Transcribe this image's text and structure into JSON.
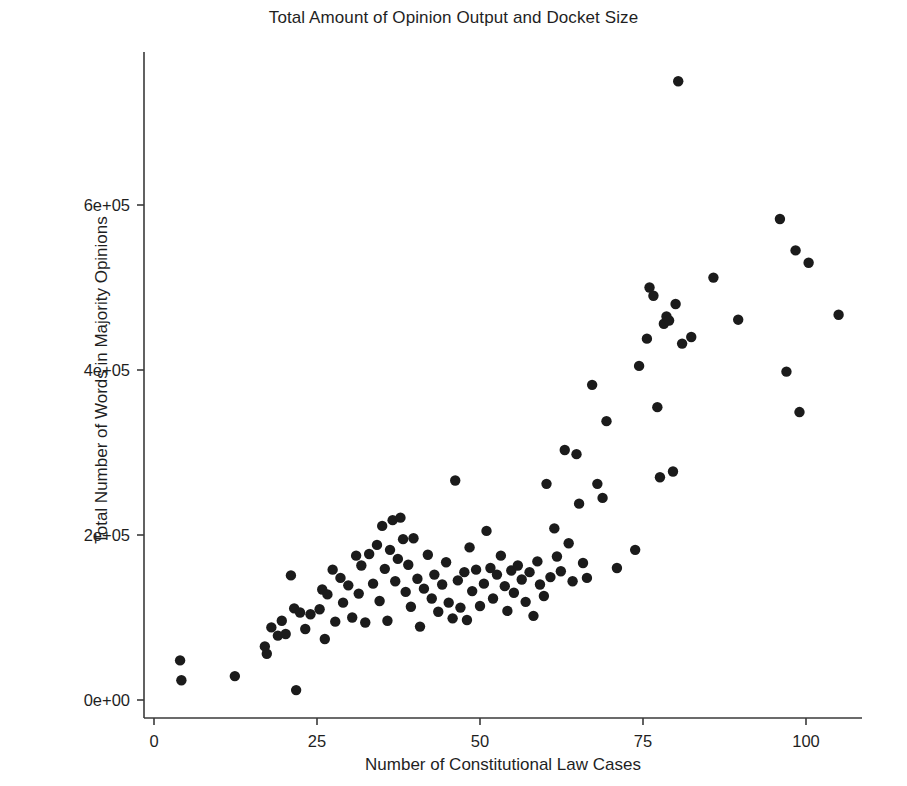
{
  "chart_data": {
    "type": "scatter",
    "title": "Total Amount of Opinion Output and Docket Size",
    "xlabel": "Number of Constitutional Law Cases",
    "ylabel": "Total Number of Words in Majority Opinions",
    "grid": false,
    "legend": "none",
    "xlim": [
      -2,
      110
    ],
    "ylim": [
      -20000,
      790000
    ],
    "xticks": [
      0,
      25,
      50,
      75,
      100
    ],
    "xtick_labels": [
      "0",
      "25",
      "50",
      "75",
      "100"
    ],
    "yticks": [
      0,
      200000,
      400000,
      600000
    ],
    "ytick_labels": [
      "0e+00",
      "2e+05",
      "4e+05",
      "6e+05"
    ],
    "marker": "filled-circle",
    "marker_color": "#1b1b1b",
    "marker_size": 5.2,
    "n_points": 120,
    "points": [
      [
        4.0,
        48000
      ],
      [
        4.2,
        24000
      ],
      [
        12.4,
        29000
      ],
      [
        17.0,
        65000
      ],
      [
        17.3,
        56000
      ],
      [
        18.0,
        88000
      ],
      [
        19.0,
        78000
      ],
      [
        19.6,
        96000
      ],
      [
        20.2,
        80000
      ],
      [
        21.0,
        151000
      ],
      [
        21.5,
        111000
      ],
      [
        21.8,
        12000
      ],
      [
        22.4,
        106000
      ],
      [
        23.2,
        86000
      ],
      [
        24.0,
        104000
      ],
      [
        25.4,
        110000
      ],
      [
        25.8,
        134000
      ],
      [
        26.2,
        74000
      ],
      [
        26.6,
        128000
      ],
      [
        27.4,
        158000
      ],
      [
        27.8,
        95000
      ],
      [
        28.6,
        148000
      ],
      [
        29.0,
        118000
      ],
      [
        29.8,
        139000
      ],
      [
        30.4,
        100000
      ],
      [
        31.0,
        175000
      ],
      [
        31.4,
        129000
      ],
      [
        31.8,
        163000
      ],
      [
        32.4,
        94000
      ],
      [
        33.0,
        177000
      ],
      [
        33.6,
        141000
      ],
      [
        34.2,
        188000
      ],
      [
        34.6,
        120000
      ],
      [
        35.0,
        211000
      ],
      [
        35.4,
        159000
      ],
      [
        35.8,
        96000
      ],
      [
        36.2,
        182000
      ],
      [
        36.6,
        218000
      ],
      [
        37.0,
        144000
      ],
      [
        37.4,
        171000
      ],
      [
        37.8,
        221000
      ],
      [
        38.2,
        195000
      ],
      [
        38.6,
        131000
      ],
      [
        39.0,
        164000
      ],
      [
        39.4,
        113000
      ],
      [
        39.8,
        196000
      ],
      [
        40.4,
        147000
      ],
      [
        40.8,
        89000
      ],
      [
        41.4,
        135000
      ],
      [
        42.0,
        176000
      ],
      [
        42.6,
        123000
      ],
      [
        43.0,
        152000
      ],
      [
        43.6,
        107000
      ],
      [
        44.2,
        140000
      ],
      [
        44.8,
        167000
      ],
      [
        45.2,
        118000
      ],
      [
        45.8,
        99000
      ],
      [
        46.2,
        266000
      ],
      [
        46.6,
        145000
      ],
      [
        47.0,
        112000
      ],
      [
        47.6,
        155000
      ],
      [
        48.0,
        97000
      ],
      [
        48.4,
        185000
      ],
      [
        48.8,
        132000
      ],
      [
        49.4,
        158000
      ],
      [
        50.0,
        114000
      ],
      [
        50.6,
        141000
      ],
      [
        51.0,
        205000
      ],
      [
        51.6,
        160000
      ],
      [
        52.0,
        123000
      ],
      [
        52.6,
        152000
      ],
      [
        53.2,
        175000
      ],
      [
        53.8,
        138000
      ],
      [
        54.2,
        108000
      ],
      [
        54.8,
        157000
      ],
      [
        55.2,
        130000
      ],
      [
        55.8,
        163000
      ],
      [
        56.4,
        146000
      ],
      [
        57.0,
        119000
      ],
      [
        57.6,
        155000
      ],
      [
        58.2,
        102000
      ],
      [
        58.8,
        168000
      ],
      [
        59.2,
        140000
      ],
      [
        59.8,
        126000
      ],
      [
        60.2,
        262000
      ],
      [
        60.8,
        149000
      ],
      [
        61.4,
        208000
      ],
      [
        61.8,
        174000
      ],
      [
        62.4,
        156000
      ],
      [
        63.0,
        303000
      ],
      [
        63.6,
        190000
      ],
      [
        64.2,
        144000
      ],
      [
        64.8,
        298000
      ],
      [
        65.2,
        238000
      ],
      [
        65.8,
        166000
      ],
      [
        66.4,
        148000
      ],
      [
        67.2,
        382000
      ],
      [
        68.0,
        262000
      ],
      [
        68.8,
        245000
      ],
      [
        69.4,
        338000
      ],
      [
        71.0,
        160000
      ],
      [
        73.8,
        182000
      ],
      [
        74.4,
        405000
      ],
      [
        75.6,
        438000
      ],
      [
        76.0,
        500000
      ],
      [
        76.6,
        490000
      ],
      [
        77.2,
        355000
      ],
      [
        77.6,
        270000
      ],
      [
        78.2,
        456000
      ],
      [
        78.6,
        465000
      ],
      [
        79.0,
        460000
      ],
      [
        79.6,
        277000
      ],
      [
        80.0,
        480000
      ],
      [
        80.4,
        750000
      ],
      [
        81.0,
        432000
      ],
      [
        82.4,
        440000
      ],
      [
        85.8,
        512000
      ],
      [
        89.6,
        461000
      ],
      [
        96.0,
        583000
      ],
      [
        97.0,
        398000
      ],
      [
        98.4,
        545000
      ],
      [
        99.0,
        349000
      ],
      [
        100.4,
        530000
      ],
      [
        105.0,
        467000
      ]
    ]
  }
}
